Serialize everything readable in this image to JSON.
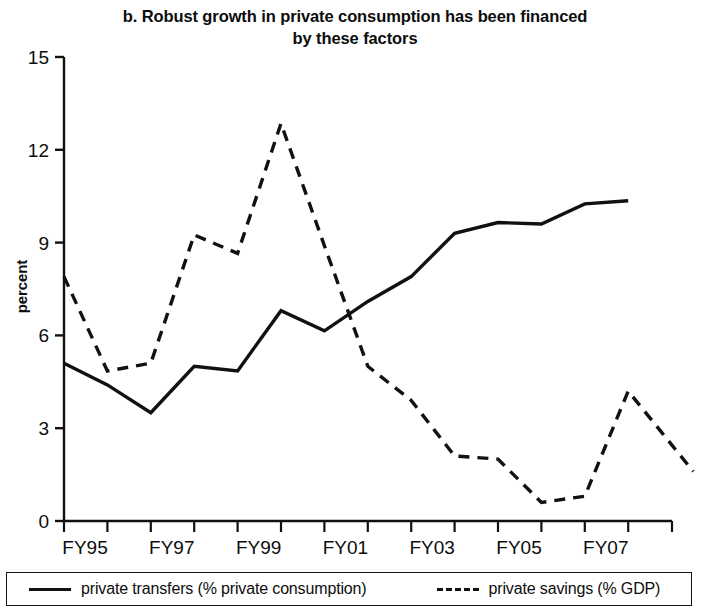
{
  "title": {
    "line1": "b. Robust growth in private consumption has been financed",
    "line2": "by these factors"
  },
  "axes": {
    "y_title": "percent",
    "y_ticks": [
      "0",
      "3",
      "6",
      "9",
      "12",
      "15"
    ],
    "x_ticks": [
      "FY95",
      "",
      "FY97",
      "",
      "FY99",
      "",
      "FY01",
      "",
      "FY03",
      "",
      "FY05",
      "",
      "FY07",
      ""
    ]
  },
  "legend": {
    "items": [
      {
        "label": "private transfers (% private consumption)",
        "style": "solid",
        "color": "#111111"
      },
      {
        "label": "private savings (% GDP)",
        "style": "dashed",
        "color": "#111111"
      }
    ]
  },
  "chart_data": {
    "type": "line",
    "title": "b. Robust growth in private consumption has been financed by these factors",
    "xlabel": "",
    "ylabel": "percent",
    "ylim": [
      0,
      15
    ],
    "yticks": [
      0,
      3,
      6,
      9,
      12,
      15
    ],
    "grid": false,
    "legend_position": "bottom",
    "categories": [
      "FY95",
      "FY96",
      "FY97",
      "FY98",
      "FY99",
      "FY00",
      "FY01",
      "FY02",
      "FY03",
      "FY04",
      "FY05",
      "FY06",
      "FY07",
      "FY08"
    ],
    "series": [
      {
        "name": "private transfers (% private consumption)",
        "style": "solid",
        "color": "#111111",
        "values": [
          5.1,
          4.4,
          3.5,
          5.0,
          4.85,
          6.8,
          6.15,
          7.1,
          7.9,
          9.3,
          9.65,
          9.6,
          10.25,
          10.35
        ]
      },
      {
        "name": "private savings (% GDP)",
        "style": "dashed",
        "color": "#111111",
        "values": [
          7.9,
          4.85,
          5.1,
          9.25,
          8.65,
          12.85,
          8.9,
          5.0,
          3.9,
          2.1,
          2.0,
          0.6,
          0.8,
          4.2
        ],
        "extra_point": {
          "x": 14.5,
          "value": 1.6
        }
      }
    ]
  }
}
